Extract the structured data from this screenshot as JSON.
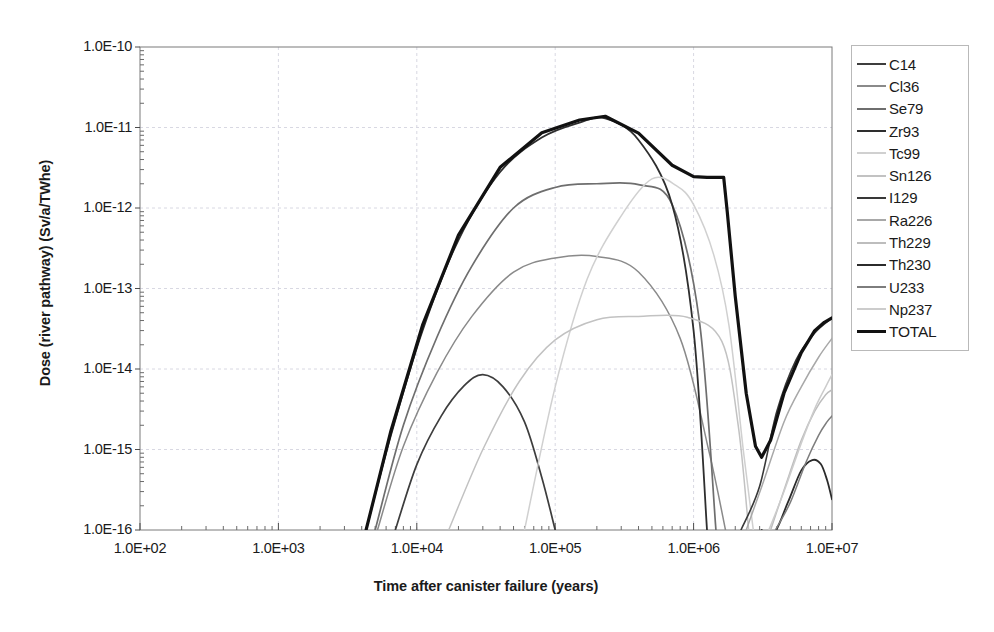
{
  "chart_data": {
    "type": "line",
    "title": "",
    "xlabel": "Time after canister failure (years)",
    "ylabel": "Dose (river pathway) (Sv/a/TWhe)",
    "xscale": "log",
    "yscale": "log",
    "xlim": [
      100,
      10000000
    ],
    "ylim": [
      1e-16,
      1e-10
    ],
    "grid": true,
    "legend_position": "right",
    "xticks": [
      "1.0E+02",
      "1.0E+03",
      "1.0E+04",
      "1.0E+05",
      "1.0E+06",
      "1.0E+07"
    ],
    "xtick_values": [
      100,
      1000,
      10000,
      100000,
      1000000,
      10000000
    ],
    "yticks": [
      "1.0E-10",
      "1.0E-11",
      "1.0E-12",
      "1.0E-13",
      "1.0E-14",
      "1.0E-15",
      "1.0E-16"
    ],
    "ytick_values": [
      1e-10,
      1e-11,
      1e-12,
      1e-13,
      1e-14,
      1e-15,
      1e-16
    ],
    "series": [
      {
        "name": "C14",
        "color": "#3d3d3d",
        "width": 1.7,
        "x": [
          7000,
          10000,
          15000,
          22000,
          30000,
          42000,
          60000,
          80000,
          100000
        ],
        "y": [
          1e-16,
          6.5e-16,
          2.6e-15,
          6.2e-15,
          8.5e-15,
          6e-15,
          2.2e-15,
          4.5e-16,
          1e-16
        ]
      },
      {
        "name": "Cl36",
        "color": "#8a8a8a",
        "width": 1.5,
        "x": [
          5200,
          8000,
          14000,
          25000,
          50000,
          100000,
          200000,
          400000,
          800000,
          1300000,
          1700000
        ],
        "y": [
          1e-16,
          1.1e-15,
          9e-15,
          4.5e-14,
          1.6e-13,
          2.4e-13,
          2.5e-13,
          1.6e-13,
          2.4e-14,
          9e-16,
          1e-16
        ]
      },
      {
        "name": "Se79",
        "color": "#6e6e6e",
        "width": 1.7,
        "x": [
          5000,
          8000,
          14000,
          25000,
          50000,
          100000,
          200000,
          400000,
          700000,
          1100000,
          1450000
        ],
        "y": [
          1e-16,
          2e-15,
          2.5e-14,
          1.9e-13,
          1e-12,
          1.8e-12,
          2e-12,
          1.95e-12,
          1.1e-12,
          4e-14,
          1e-16
        ]
      },
      {
        "name": "Zr93",
        "color": "#2e2e2e",
        "width": 1.8,
        "x": [
          4300,
          6500,
          11000,
          20000,
          40000,
          80000,
          150000,
          230000,
          400000,
          700000,
          1000000,
          1250000
        ],
        "y": [
          1e-16,
          1.5e-15,
          3e-14,
          4e-13,
          2.8e-12,
          7.5e-12,
          1.15e-11,
          1.3e-11,
          7e-12,
          1.1e-12,
          3e-14,
          1e-16
        ]
      },
      {
        "name": "Tc99",
        "color": "#d0d0d0",
        "width": 1.5,
        "x": [
          60000,
          100000,
          170000,
          300000,
          500000,
          750000,
          1000000,
          1400000,
          1800000,
          2300000,
          2700000
        ],
        "y": [
          1e-16,
          6e-15,
          1.3e-13,
          8e-13,
          2.3e-12,
          1.9e-12,
          1.1e-12,
          2.6e-13,
          3.5e-14,
          9e-16,
          1e-16
        ]
      },
      {
        "name": "Sn126",
        "color": "#c2c2c2",
        "width": 1.5,
        "x": [
          17000,
          30000,
          55000,
          100000,
          200000,
          400000,
          900000,
          1600000,
          2100000,
          2500000
        ],
        "y": [
          1e-16,
          1e-15,
          7e-15,
          2.3e-14,
          4.1e-14,
          4.5e-14,
          4.4e-14,
          2.2e-14,
          2e-15,
          1e-16
        ]
      },
      {
        "name": "I129",
        "color": "#383838",
        "width": 1.6,
        "x": [
          2200000,
          3000000,
          4000000,
          5500000,
          7500000,
          10000000
        ],
        "y": [
          1e-16,
          3.5e-16,
          3e-15,
          1.3e-14,
          2.8e-14,
          4.3e-14
        ]
      },
      {
        "name": "Ra226",
        "color": "#a8a8a8",
        "width": 1.5,
        "x": [
          2400000,
          3200000,
          4500000,
          6000000,
          8000000,
          10000000
        ],
        "y": [
          1e-16,
          4e-16,
          2.2e-15,
          6e-15,
          1.4e-14,
          2.4e-14
        ]
      },
      {
        "name": "Th229",
        "color": "#bdbdbd",
        "width": 1.5,
        "x": [
          3600000,
          4600000,
          6000000,
          7500000,
          9000000,
          10000000
        ],
        "y": [
          1e-16,
          3.5e-16,
          1.3e-15,
          3e-15,
          4.8e-15,
          5.5e-15
        ]
      },
      {
        "name": "Th230",
        "color": "#2b2b2b",
        "width": 1.8,
        "x": [
          3100000,
          3800000,
          4800000,
          6000000,
          7200000,
          8300000,
          9200000,
          10000000
        ],
        "y": [
          1e-16,
          9e-17,
          2.2e-16,
          5.5e-16,
          7.4e-16,
          6.6e-16,
          4.2e-16,
          2.4e-16
        ]
      },
      {
        "name": "U233",
        "color": "#7d7d7d",
        "width": 1.5,
        "x": [
          3900000,
          5000000,
          6500000,
          8000000,
          9200000,
          10000000
        ],
        "y": [
          1e-16,
          2.2e-16,
          7e-16,
          1.5e-15,
          2.2e-15,
          2.6e-15
        ]
      },
      {
        "name": "Np237",
        "color": "#cccccc",
        "width": 1.5,
        "x": [
          3500000,
          4500000,
          6000000,
          7500000,
          9000000,
          10000000
        ],
        "y": [
          1e-16,
          3e-16,
          1.2e-15,
          3.2e-15,
          6e-15,
          8.5e-15
        ]
      },
      {
        "name": "TOTAL",
        "color": "#111111",
        "width": 3.2,
        "x": [
          4300,
          6500,
          11000,
          20000,
          40000,
          80000,
          150000,
          230000,
          400000,
          700000,
          1000000,
          1250000,
          1500000,
          1650000,
          1750000,
          2000000,
          2400000,
          2800000,
          3100000,
          3600000,
          4500000,
          6000000,
          7500000,
          8800000,
          10000000
        ],
        "y": [
          1e-16,
          1.7e-15,
          3.5e-14,
          4.6e-13,
          3.2e-12,
          8.6e-12,
          1.24e-11,
          1.38e-11,
          8.5e-12,
          3.4e-12,
          2.45e-12,
          2.4e-12,
          2.4e-12,
          2.4e-12,
          9e-13,
          8e-14,
          5e-15,
          1.1e-15,
          8e-16,
          1.3e-15,
          5e-15,
          1.6e-14,
          3e-14,
          3.8e-14,
          4.3e-14
        ]
      }
    ]
  },
  "legend": {
    "items": [
      {
        "label": "C14"
      },
      {
        "label": "Cl36"
      },
      {
        "label": "Se79"
      },
      {
        "label": "Zr93"
      },
      {
        "label": "Tc99"
      },
      {
        "label": "Sn126"
      },
      {
        "label": "I129"
      },
      {
        "label": "Ra226"
      },
      {
        "label": "Th229"
      },
      {
        "label": "Th230"
      },
      {
        "label": "U233"
      },
      {
        "label": "Np237"
      },
      {
        "label": "TOTAL"
      }
    ]
  }
}
